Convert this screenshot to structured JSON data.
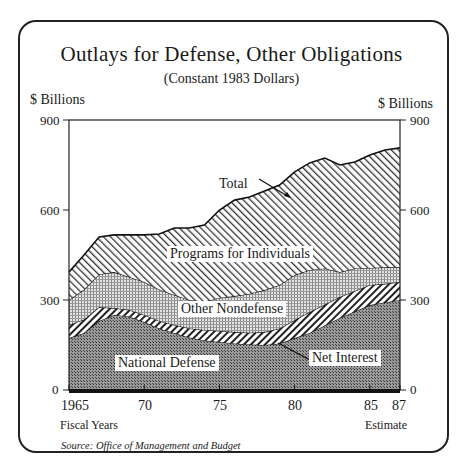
{
  "header": {
    "title": "Outlays for Defense, Other Obligations",
    "subtitle": "(Constant 1983 Dollars)",
    "left_axis_unit": "$ Billions",
    "right_axis_unit": "$ Billions"
  },
  "axes": {
    "y_ticks": [
      "900",
      "600",
      "300",
      "0"
    ],
    "x_ticks": [
      "1965",
      "70",
      "75",
      "80",
      "85",
      "87"
    ],
    "x_label": "Fiscal Years",
    "estimate_label": "Estimate"
  },
  "labels": {
    "total": "Total",
    "programs": "Programs for Individuals",
    "other": "Other Nondefense",
    "interest": "Net Interest",
    "defense": "National Defense"
  },
  "footer": {
    "source": "Source: Office of Management and Budget"
  },
  "chart_data": {
    "type": "area",
    "stacked": true,
    "title": "Outlays for Defense, Other Obligations",
    "subtitle": "(Constant 1983 Dollars)",
    "xlabel": "Fiscal Years",
    "ylabel": "$ Billions",
    "ylim": [
      0,
      900
    ],
    "yticks": [
      0,
      300,
      600,
      900
    ],
    "xticks": [
      1965,
      1970,
      1975,
      1980,
      1985,
      1987
    ],
    "x": [
      1965,
      1966,
      1967,
      1968,
      1969,
      1970,
      1971,
      1972,
      1973,
      1974,
      1975,
      1976,
      1977,
      1978,
      1979,
      1980,
      1981,
      1982,
      1983,
      1984,
      1985,
      1986,
      1987
    ],
    "series": [
      {
        "name": "National Defense",
        "values": [
          173,
          190,
          230,
          250,
          245,
          227,
          205,
          190,
          175,
          165,
          160,
          155,
          152,
          150,
          155,
          173,
          190,
          215,
          240,
          262,
          283,
          292,
          300
        ]
      },
      {
        "name": "Net Interest",
        "values": [
          44,
          45,
          46,
          23,
          22,
          23,
          25,
          27,
          30,
          35,
          37,
          38,
          39,
          43,
          50,
          60,
          70,
          70,
          70,
          68,
          67,
          62,
          60
        ]
      },
      {
        "name": "Other Nondefense",
        "values": [
          83,
          100,
          110,
          120,
          110,
          110,
          105,
          100,
          95,
          95,
          110,
          120,
          130,
          140,
          145,
          150,
          140,
          120,
          83,
          75,
          57,
          55,
          50
        ]
      },
      {
        "name": "Programs for Individuals",
        "values": [
          93,
          115,
          124,
          124,
          140,
          157,
          185,
          223,
          240,
          255,
          293,
          320,
          322,
          330,
          333,
          344,
          357,
          368,
          357,
          355,
          376,
          391,
          397
        ]
      }
    ],
    "total": [
      393,
      450,
      510,
      517,
      517,
      517,
      520,
      540,
      540,
      550,
      600,
      633,
      643,
      663,
      683,
      727,
      757,
      773,
      750,
      760,
      783,
      800,
      807
    ],
    "annotations": [
      "Total",
      "Net Interest"
    ],
    "source": "Source: Office of Management and Budget",
    "note": "1986-87 Estimate",
    "grid": false,
    "legend_position": "inline labels"
  }
}
